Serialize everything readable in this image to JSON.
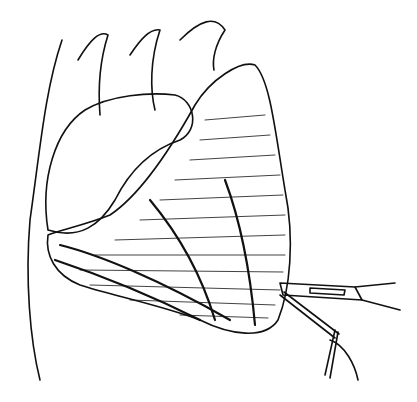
{
  "image": {
    "description": "Black-and-white medical line illustration of a heart with surgical instruments (scalpel and probe) at the apex",
    "colors": {
      "ink": "#111111",
      "background": "#ffffff"
    }
  }
}
